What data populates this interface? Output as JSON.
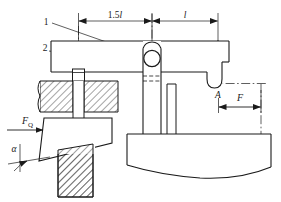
{
  "diagram": {
    "colors": {
      "line": "#1a1a1a",
      "hatch": "#1a1a1a",
      "background": "#ffffff",
      "center_line": "#1a1a1a"
    },
    "labels": {
      "part_1": "1",
      "part_2": "2",
      "dim_left": "1.5l",
      "dim_left_value": "1.5",
      "dim_left_symbol": "l",
      "dim_right": "l",
      "point_a": "A",
      "force_f": "F",
      "force_fq": "F",
      "force_fq_subscript": "Q",
      "angle_alpha": "α"
    },
    "annotations": [
      {
        "name": "leader-1",
        "text": "1",
        "target": "lever arm"
      },
      {
        "name": "leader-2",
        "text": "2",
        "target": "clamp pad"
      },
      {
        "name": "dimension-1.5l",
        "text": "1.5l"
      },
      {
        "name": "dimension-l",
        "text": "l"
      },
      {
        "name": "point-label-A",
        "text": "A"
      },
      {
        "name": "force-arrow-F",
        "text": "F"
      },
      {
        "name": "force-arrow-FQ",
        "text": "FQ"
      },
      {
        "name": "angle-alpha",
        "text": "α"
      }
    ]
  }
}
